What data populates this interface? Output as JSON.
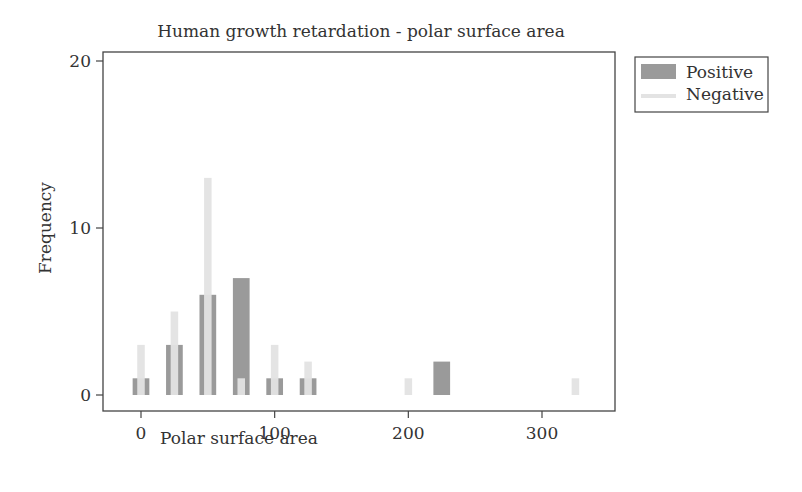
{
  "chart_data": {
    "type": "bar",
    "title": "Human growth retardation - polar surface area",
    "xlabel": "Polar surface area",
    "ylabel": "Frequency",
    "xlim": [
      -28,
      352
    ],
    "ylim": [
      -1,
      20.2
    ],
    "xticks": [
      0,
      100,
      200,
      300
    ],
    "yticks": [
      0,
      10,
      20
    ],
    "grid": false,
    "legend_position": "outside-right-top",
    "bin_width": 12.5,
    "series": [
      {
        "name": "Positive",
        "color": "#9a9a9a",
        "points": [
          {
            "x": 0,
            "y": 1
          },
          {
            "x": 25,
            "y": 3
          },
          {
            "x": 50,
            "y": 6
          },
          {
            "x": 75,
            "y": 7
          },
          {
            "x": 100,
            "y": 1
          },
          {
            "x": 125,
            "y": 1
          },
          {
            "x": 225,
            "y": 2
          }
        ]
      },
      {
        "name": "Negative",
        "color": "#e3e3e3",
        "points": [
          {
            "x": 0,
            "y": 3
          },
          {
            "x": 25,
            "y": 5
          },
          {
            "x": 50,
            "y": 13
          },
          {
            "x": 75,
            "y": 1
          },
          {
            "x": 100,
            "y": 3
          },
          {
            "x": 125,
            "y": 2
          },
          {
            "x": 200,
            "y": 1
          },
          {
            "x": 325,
            "y": 1
          }
        ]
      }
    ]
  },
  "labels": {
    "title": "Human growth retardation - polar surface area",
    "xlabel": "Polar surface area",
    "ylabel": "Frequency",
    "legend_positive": "Positive",
    "legend_negative": "Negative"
  }
}
